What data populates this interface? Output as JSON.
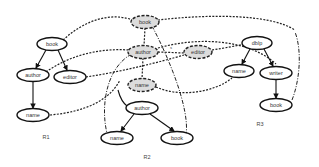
{
  "diagram": {
    "type": "graph-matching",
    "regions": [
      {
        "id": "R1",
        "label": "R1"
      },
      {
        "id": "R2",
        "label": "R2"
      },
      {
        "id": "R3",
        "label": "R3"
      }
    ],
    "nodes": {
      "r1_book": {
        "label": "book",
        "region": "R1",
        "style": "solid"
      },
      "r1_author": {
        "label": "author",
        "region": "R1",
        "style": "solid"
      },
      "r1_editor": {
        "label": "editor",
        "region": "R1",
        "style": "solid"
      },
      "r1_name": {
        "label": "name",
        "region": "R1",
        "style": "solid"
      },
      "r2_book_q": {
        "label": "book",
        "region": "R2",
        "style": "dashed-gray"
      },
      "r2_author_q": {
        "label": "author",
        "region": "R2",
        "style": "dashed-gray"
      },
      "r2_editor_q": {
        "label": "editor",
        "region": "R2",
        "style": "dashed-gray"
      },
      "r2_name_q": {
        "label": "name",
        "region": "R2",
        "style": "dashed-gray"
      },
      "r2_author": {
        "label": "author",
        "region": "R2",
        "style": "solid"
      },
      "r2_name": {
        "label": "name",
        "region": "R2",
        "style": "solid"
      },
      "r2_book": {
        "label": "book",
        "region": "R2",
        "style": "solid"
      },
      "r3_dblp": {
        "label": "dblp",
        "region": "R3",
        "style": "solid"
      },
      "r3_name": {
        "label": "name",
        "region": "R3",
        "style": "solid"
      },
      "r3_writer": {
        "label": "writer",
        "region": "R3",
        "style": "solid"
      },
      "r3_book": {
        "label": "book",
        "region": "R3",
        "style": "solid"
      }
    },
    "small_marks": {
      "between_author_editor": "s"
    },
    "colors": {
      "dashed_node_fill": "#dcdcdc",
      "stroke": "#111111",
      "background": "#ffffff"
    }
  }
}
